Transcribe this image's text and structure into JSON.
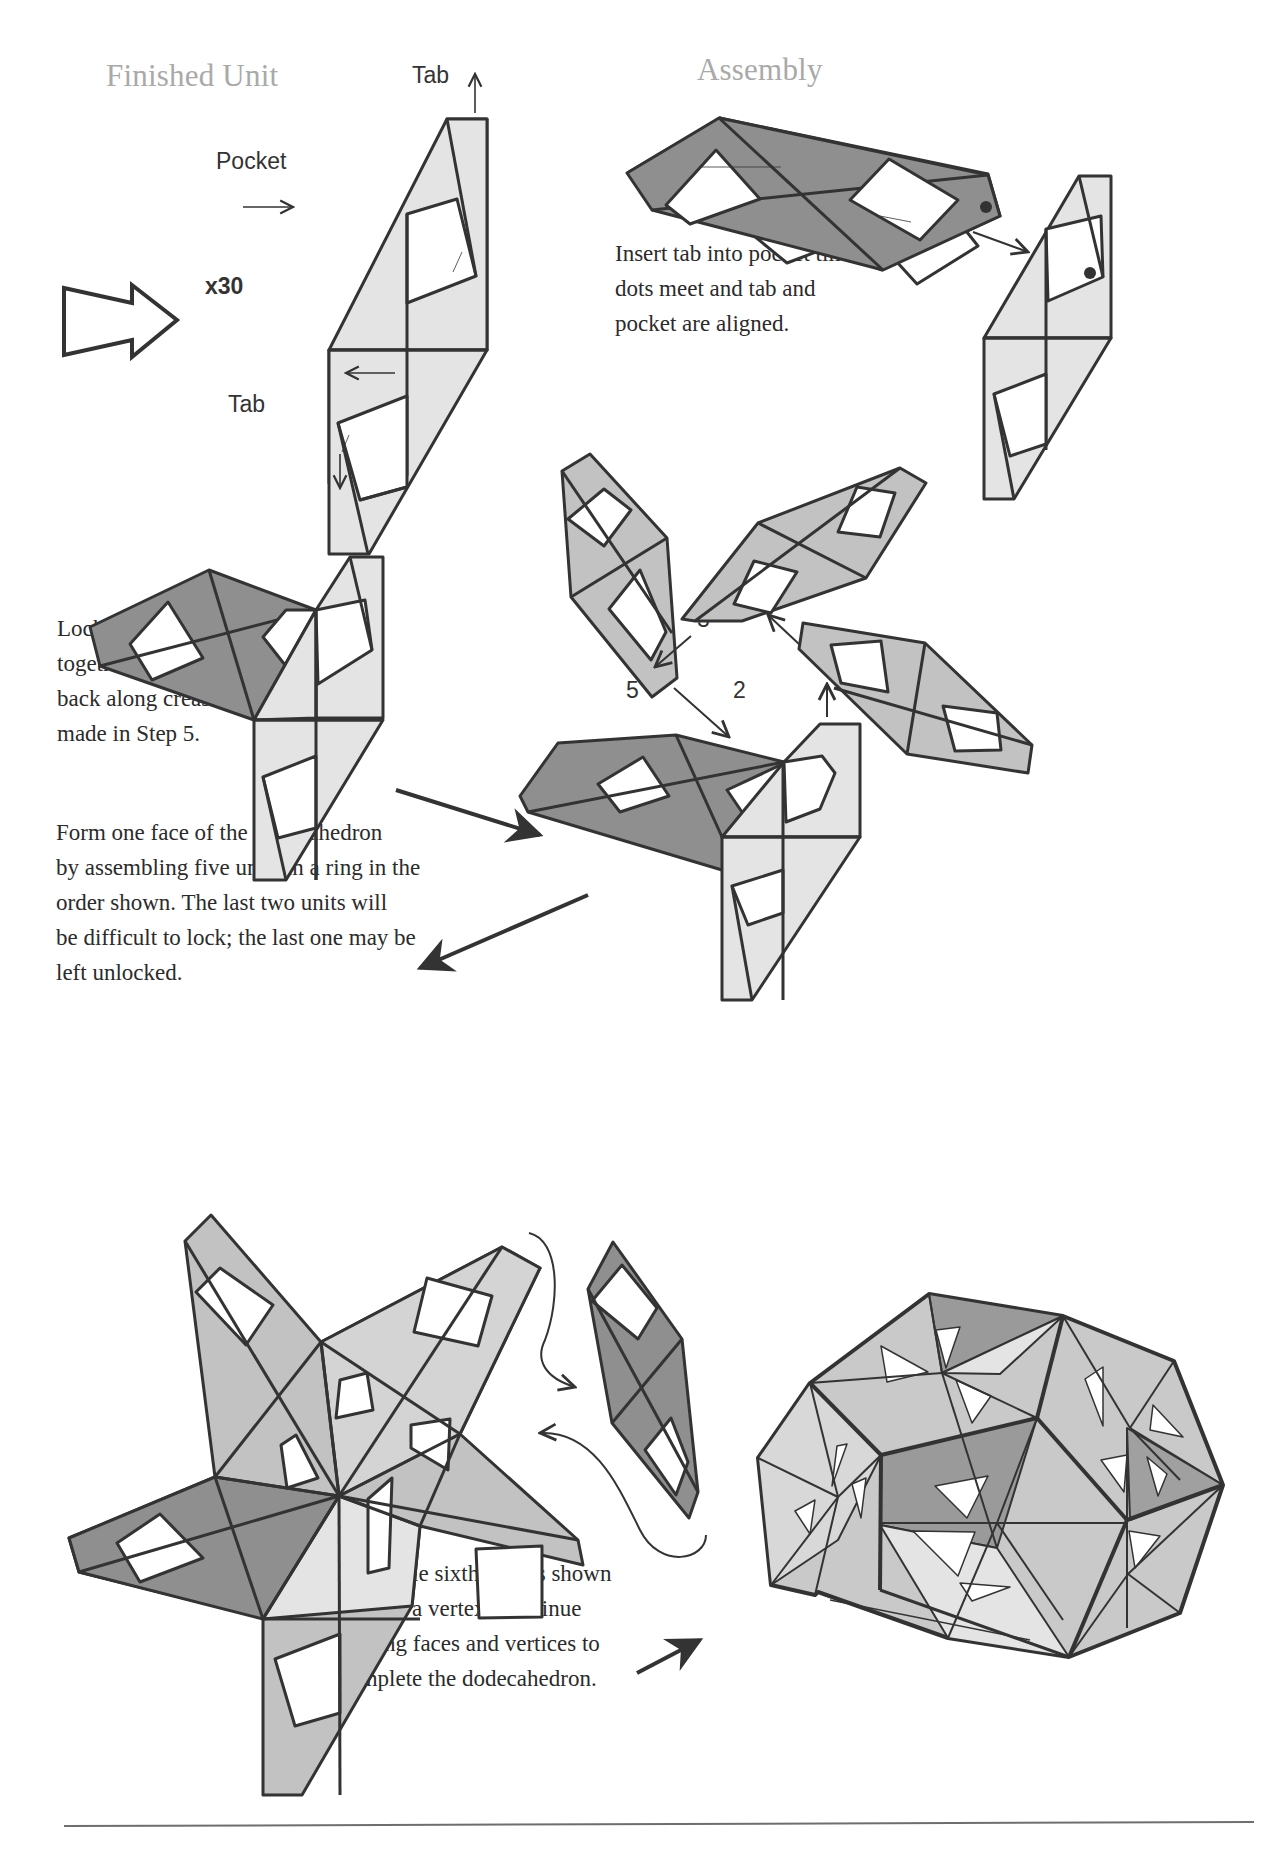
{
  "headings": {
    "finished_unit": "Finished Unit",
    "assembly": "Assembly"
  },
  "finished_unit": {
    "tab_top_label": "Tab",
    "tab_bottom_label": "Tab",
    "pocket_top_label": "Pocket",
    "pocket_bottom_label": "Pocket",
    "quantity_label": "x30",
    "icons": [
      "outline-right-arrow-icon",
      "up-arrow-icon",
      "down-arrow-icon",
      "right-arrow-icon",
      "left-arrow-icon"
    ]
  },
  "assembly": {
    "instruction_lines": [
      "Insert tab into pocket till",
      "dots meet and tab and",
      "pocket are aligned."
    ]
  },
  "lock_step": {
    "instruction_lines": [
      "Lock two units",
      "together by tucking",
      "back along crease",
      "made in Step 5."
    ]
  },
  "ring_step": {
    "order_labels": [
      "2",
      "3",
      "4",
      "5"
    ],
    "instruction_lines": [
      "Form one face of the dodecahedron",
      "by assembling five units in a ring in the",
      "order shown.  The last two units will",
      "be difficult to lock;  the last one may be",
      "left unlocked."
    ]
  },
  "vertex_step": {
    "instruction_lines": [
      "Assemble sixth unit as shown",
      "to form a vertex.  Continue",
      "making faces and vertices to",
      "complete the dodecahedron."
    ]
  },
  "colors": {
    "light_unit": "#e4e4e4",
    "mid_unit": "#c2c2c2",
    "dark_unit": "#8f8f8f",
    "outline": "#333333",
    "heading": "#a9a9a9",
    "text": "#2b2b2b"
  }
}
